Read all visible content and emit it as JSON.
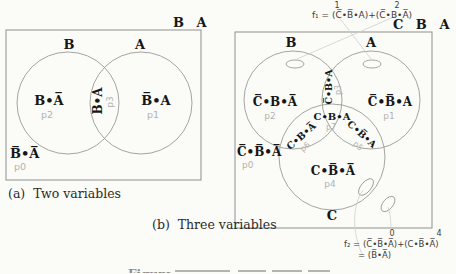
{
  "left": {
    "corner_label": "B A",
    "set_b": "B",
    "set_a": "A",
    "regions": {
      "b_only": {
        "label": "B•A̅",
        "p": "p2"
      },
      "a_only": {
        "label": "B̅•A",
        "p": "p1"
      },
      "b_and_a": {
        "label": "B•A",
        "p": "p3"
      },
      "outside": {
        "label": "B̅•A̅",
        "p": "p0"
      }
    },
    "caption": "(a)  Two variables"
  },
  "right": {
    "f1": {
      "term1_num": "1",
      "term2_num": "2",
      "text": "f₁ = (C̅•B̅•A)+(C̅•B•A̅)"
    },
    "corner_label": "C B A",
    "set_b": "B",
    "set_a": "A",
    "set_c": "C",
    "regions": {
      "b_only": {
        "label": "C̅•B•A̅",
        "p": "p2"
      },
      "a_only": {
        "label": "C̅•B̅•A",
        "p": "p1"
      },
      "b_a": {
        "label": "C̅•B•A",
        "p": "p3"
      },
      "center": {
        "label": "C•B•A",
        "p": "p7"
      },
      "b_c": {
        "label": "C•B•A̅",
        "p": "p6"
      },
      "a_c": {
        "label": "C•B̅•A",
        "p": "p5"
      },
      "c_only": {
        "label": "C•B̅•A̅",
        "p": "p4"
      },
      "outside": {
        "label": "C̅•B̅•A̅",
        "p": "p0"
      }
    },
    "caption": "(b)  Three variables",
    "f2": {
      "term1_num": "0",
      "term2_num": "4",
      "line1": "f₂ = (C̅•B̅•A̅)+(C•B̅•A̅)",
      "line2": "= (B̅•A̅)"
    }
  },
  "partial_caption": "Figure"
}
